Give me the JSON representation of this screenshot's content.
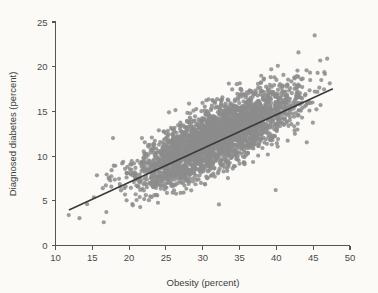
{
  "chart_data": {
    "type": "scatter",
    "title": "",
    "subtitle": "",
    "xlabel": "Obesity (percent)",
    "ylabel": "Diagnosed diabetes (percent)",
    "xlim": [
      10,
      50
    ],
    "ylim": [
      0,
      25
    ],
    "xticks": [
      10,
      15,
      20,
      25,
      30,
      35,
      40,
      45,
      50
    ],
    "yticks": [
      0,
      5,
      10,
      15,
      20,
      25
    ],
    "xtick_labels": [
      "10",
      "15",
      "20",
      "25",
      "30",
      "35",
      "40",
      "45",
      "50"
    ],
    "ytick_labels": [
      "0",
      "5",
      "10",
      "15",
      "20",
      "25"
    ],
    "grid": false,
    "legend": null,
    "legend_position": "none",
    "annotations": [],
    "point_color": "#8c8c8c",
    "point_radius": 2.1,
    "point_opacity": 0.85,
    "trendline": {
      "type": "line",
      "color": "#3a3a3a",
      "width": 1.6,
      "x": [
        11.9,
        47.6
      ],
      "y": [
        4.0,
        17.5
      ],
      "slope": 0.378,
      "intercept": -0.5
    },
    "n_points": 3140,
    "distribution": {
      "x_mean": 32.0,
      "x_sd": 5.2,
      "x_min": 11.8,
      "x_max": 47.5,
      "residual_sd": 1.55,
      "residual_skew": 0.35
    },
    "outliers": [
      {
        "x": 45.2,
        "y": 23.5
      },
      {
        "x": 43.0,
        "y": 21.6
      },
      {
        "x": 46.9,
        "y": 20.9
      },
      {
        "x": 40.2,
        "y": 20.1
      },
      {
        "x": 44.1,
        "y": 19.6
      },
      {
        "x": 45.6,
        "y": 19.3
      },
      {
        "x": 46.1,
        "y": 18.5
      },
      {
        "x": 44.6,
        "y": 18.5
      },
      {
        "x": 32.2,
        "y": 4.6
      },
      {
        "x": 39.9,
        "y": 6.2
      },
      {
        "x": 11.8,
        "y": 3.4
      }
    ]
  },
  "axes": {
    "x_title": "Obesity (percent)",
    "y_title": "Diagnosed diabetes (percent)"
  },
  "colors": {
    "background": "#fbfaf7",
    "points": "#8c8c8c",
    "trendline": "#3a3a3a",
    "axis": "#555555",
    "text": "#3c3c3c"
  }
}
